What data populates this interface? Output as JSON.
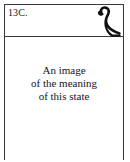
{
  "figure": {
    "label": "13C.",
    "glyph": {
      "name": "cobra-hieroglyph",
      "description": "hooked serpent hieroglyph"
    },
    "caption": {
      "lines": [
        "An image",
        "of the meaning",
        "of this state"
      ]
    },
    "colors": {
      "border": "#3a3a3a",
      "text": "#151515",
      "background": "#ffffff",
      "glyph_stroke": "#101010"
    }
  }
}
